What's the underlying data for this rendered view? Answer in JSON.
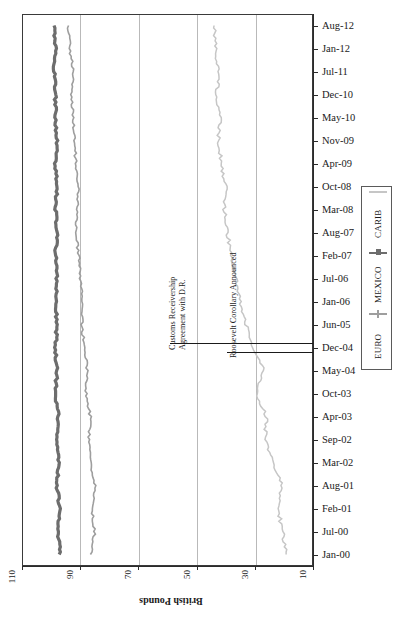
{
  "chart_data": {
    "type": "line",
    "title": "",
    "orientation": "rotated-90",
    "xlabel": "",
    "ylabel": "British Pounds",
    "ylim": [
      10,
      110
    ],
    "yticks": [
      110,
      90,
      70,
      50,
      30,
      10
    ],
    "grid": true,
    "legend_position": "right",
    "categories": [
      "Jan-00",
      "Jul-00",
      "Feb-01",
      "Aug-01",
      "Mar-02",
      "Sep-02",
      "Apr-03",
      "Oct-03",
      "May-04",
      "Dec-04",
      "Jun-05",
      "Jan-06",
      "Jul-06",
      "Feb-07",
      "Aug-07",
      "Mar-08",
      "Oct-08",
      "Apr-09",
      "Nov-09",
      "May-10",
      "Dec-10",
      "Jul-11",
      "Jan-12",
      "Aug-12"
    ],
    "series": [
      {
        "name": "EURO",
        "color": "#9e9e9e",
        "values": [
          86.5,
          85.0,
          86.0,
          85.0,
          86.5,
          87.0,
          86.5,
          88.0,
          87.5,
          88.5,
          89.5,
          89.0,
          90.0,
          90.5,
          91.5,
          91.0,
          90.5,
          91.5,
          92.0,
          92.5,
          93.0,
          92.5,
          93.5,
          94.0
        ]
      },
      {
        "name": "MEXICO",
        "color": "#6d6d6d",
        "values": [
          97.0,
          97.5,
          97.0,
          98.0,
          97.5,
          98.0,
          97.5,
          98.5,
          98.0,
          98.5,
          98.0,
          98.5,
          98.0,
          98.5,
          98.0,
          98.5,
          98.0,
          98.5,
          98.0,
          98.5,
          98.5,
          99.0,
          98.5,
          99.0
        ]
      },
      {
        "name": "CARIB",
        "color": "#c6c6c6",
        "values": [
          19.0,
          20.5,
          22.0,
          20.5,
          24.0,
          26.5,
          26.0,
          29.5,
          27.0,
          30.5,
          33.0,
          35.0,
          36.5,
          38.0,
          39.5,
          40.5,
          40.0,
          41.5,
          42.5,
          42.0,
          43.0,
          42.5,
          43.5,
          44.0
        ]
      }
    ],
    "annotations": [
      {
        "label": "Customs Receivership\nAgreement with D.R.",
        "category": "Dec-04"
      },
      {
        "label": "Roosevelt Corollary Announced",
        "category": "Dec-04"
      }
    ]
  },
  "axis": {
    "value_title": "British Pounds",
    "value_ticks": [
      "110",
      "90",
      "70",
      "50",
      "30",
      "10"
    ],
    "category_labels": [
      "Aug-12",
      "Jan-12",
      "Jul-11",
      "Dec-10",
      "May-10",
      "Nov-09",
      "Apr-09",
      "Oct-08",
      "Mar-08",
      "Aug-07",
      "Feb-07",
      "Jul-06",
      "Jan-06",
      "Jun-05",
      "Dec-04",
      "May-04",
      "Oct-03",
      "Apr-03",
      "Sep-02",
      "Mar-02",
      "Aug-01",
      "Feb-01",
      "Jul-00",
      "Jan-00"
    ]
  },
  "legend": {
    "items": [
      {
        "label": "CARIB",
        "color": "#c6c6c6",
        "marker": "line"
      },
      {
        "label": "MEXICO",
        "color": "#6d6d6d",
        "marker": "square"
      },
      {
        "label": "EURO",
        "color": "#9e9e9e",
        "marker": "cross"
      }
    ]
  },
  "annotations": {
    "customs": {
      "line1": "Customs Receivership",
      "line2": "Agreement with D.R."
    },
    "roosevelt": {
      "line1": "Roosevelt Corollary Announced"
    }
  }
}
